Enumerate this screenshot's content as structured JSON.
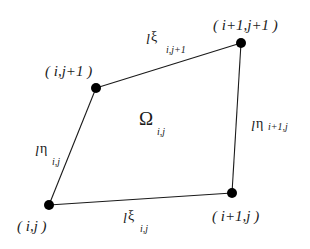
{
  "diagram": {
    "type": "quadrilateral-cell",
    "colors": {
      "line": "#1a1a1a",
      "node": "#000000",
      "background": "#ffffff"
    },
    "nodes": [
      {
        "id": "ij",
        "label": "( i,j )",
        "x": 49,
        "y": 205
      },
      {
        "id": "i1j",
        "label": "( i+1,j )",
        "x": 232,
        "y": 193
      },
      {
        "id": "i1j1",
        "label": "( i+1,j+1 )",
        "x": 241,
        "y": 43
      },
      {
        "id": "ij1",
        "label": "( i,j+1 )",
        "x": 96,
        "y": 88
      }
    ],
    "edges": {
      "bottom": {
        "prefix": "l",
        "greek": "ξ",
        "subscript": "i,j"
      },
      "top": {
        "prefix": "l",
        "greek": "ξ",
        "subscript": "i,j+1"
      },
      "left": {
        "prefix": "l",
        "greek": "η",
        "subscript": "i,j"
      },
      "right": {
        "prefix": "l",
        "greek": "η",
        "subscript": "i+1,j"
      }
    },
    "cell": {
      "symbol": "Ω",
      "subscript": "i,j"
    }
  }
}
